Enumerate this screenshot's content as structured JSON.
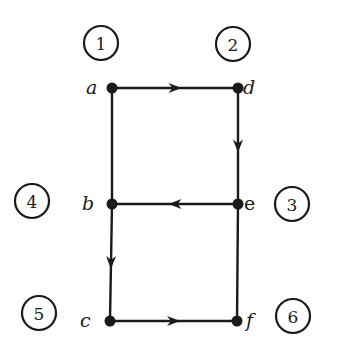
{
  "diagram": {
    "type": "directed-graph",
    "nodes": [
      {
        "id": "a",
        "label": "a",
        "x": 112,
        "y": 88,
        "lx": 86,
        "ly": 94
      },
      {
        "id": "d",
        "label": "d",
        "x": 238,
        "y": 88,
        "lx": 243,
        "ly": 94
      },
      {
        "id": "b",
        "label": "b",
        "x": 112,
        "y": 204,
        "lx": 82,
        "ly": 210
      },
      {
        "id": "e",
        "label": "e",
        "x": 238,
        "y": 204,
        "lx": 244,
        "ly": 210
      },
      {
        "id": "c",
        "label": "c",
        "x": 110,
        "y": 321,
        "lx": 80,
        "ly": 327
      },
      {
        "id": "f",
        "label": "f",
        "x": 237,
        "y": 321,
        "lx": 246,
        "ly": 327
      }
    ],
    "edges": [
      {
        "from": "a",
        "to": "d",
        "directed": true
      },
      {
        "from": "d",
        "to": "e",
        "directed": true
      },
      {
        "from": "e",
        "to": "b",
        "directed": true
      },
      {
        "from": "b",
        "to": "c",
        "directed": true
      },
      {
        "from": "c",
        "to": "f",
        "directed": true
      },
      {
        "from": "a",
        "to": "b",
        "directed": false
      },
      {
        "from": "e",
        "to": "f",
        "directed": false
      }
    ],
    "region_markers": [
      {
        "label": "1",
        "x": 101,
        "y": 43
      },
      {
        "label": "2",
        "x": 233,
        "y": 44
      },
      {
        "label": "3",
        "x": 292,
        "y": 204
      },
      {
        "label": "4",
        "x": 32,
        "y": 201
      },
      {
        "label": "5",
        "x": 39,
        "y": 313
      },
      {
        "label": "6",
        "x": 293,
        "y": 316
      }
    ],
    "colors": {
      "ink": "#1a1a1a",
      "background": "#ffffff"
    }
  }
}
